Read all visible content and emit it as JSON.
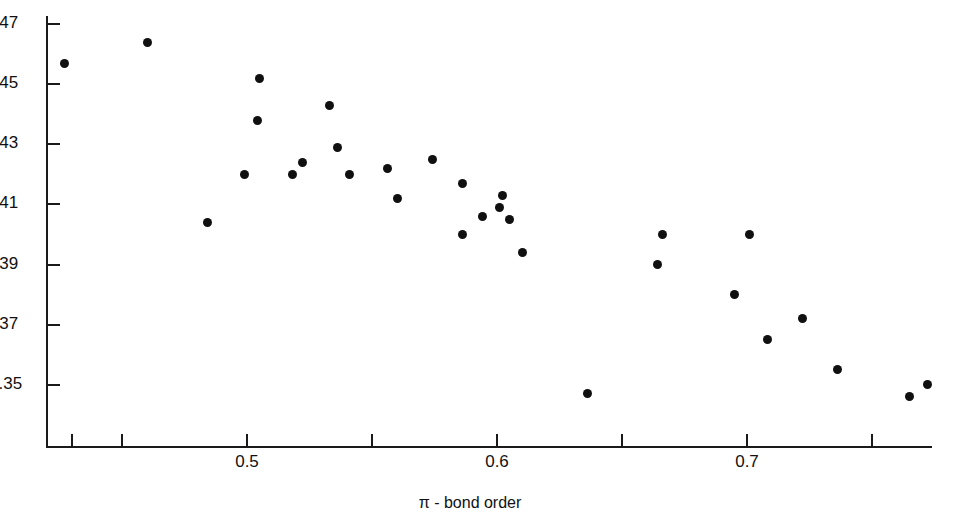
{
  "figure": {
    "background_color": "#ffffff",
    "marker_color": "#101010",
    "axis_color": "#1a1a1a"
  },
  "axes": {
    "x_title": "π - bond order",
    "x_tick_labels": [
      "0.5",
      "0.6",
      "0.7"
    ],
    "x_labeled_ticks": [
      0.5,
      0.6,
      0.7
    ],
    "x_all_ticks": [
      0.43,
      0.45,
      0.5,
      0.55,
      0.6,
      0.65,
      0.7,
      0.75
    ],
    "y_tick_labels": [
      "1.47",
      "1.45",
      "1.43",
      "1.41",
      "1.39",
      "1.37",
      "1.35"
    ],
    "y_ticks": [
      1.47,
      1.45,
      1.43,
      1.41,
      1.39,
      1.37,
      1.35
    ]
  },
  "chart_data": {
    "type": "scatter",
    "title": "",
    "xlabel": "π - bond order",
    "ylabel": "",
    "xlim": [
      0.419,
      0.776
    ],
    "ylim": [
      1.341,
      1.474
    ],
    "grid": false,
    "legend": "none",
    "x_ticks": [
      0.5,
      0.6,
      0.7
    ],
    "y_ticks": [
      1.35,
      1.37,
      1.39,
      1.41,
      1.43,
      1.45,
      1.47
    ],
    "series": [
      {
        "name": "bond length vs pi-bond order",
        "marker": "filled-circle",
        "color": "#101010",
        "points": [
          {
            "x": 0.427,
            "y": 1.457
          },
          {
            "x": 0.46,
            "y": 1.464
          },
          {
            "x": 0.484,
            "y": 1.404
          },
          {
            "x": 0.505,
            "y": 1.452
          },
          {
            "x": 0.504,
            "y": 1.438
          },
          {
            "x": 0.499,
            "y": 1.42
          },
          {
            "x": 0.518,
            "y": 1.42
          },
          {
            "x": 0.522,
            "y": 1.424
          },
          {
            "x": 0.533,
            "y": 1.443
          },
          {
            "x": 0.536,
            "y": 1.429
          },
          {
            "x": 0.541,
            "y": 1.42
          },
          {
            "x": 0.556,
            "y": 1.422
          },
          {
            "x": 0.56,
            "y": 1.412
          },
          {
            "x": 0.574,
            "y": 1.425
          },
          {
            "x": 0.586,
            "y": 1.417
          },
          {
            "x": 0.586,
            "y": 1.4
          },
          {
            "x": 0.594,
            "y": 1.406
          },
          {
            "x": 0.602,
            "y": 1.413
          },
          {
            "x": 0.601,
            "y": 1.409
          },
          {
            "x": 0.605,
            "y": 1.405
          },
          {
            "x": 0.61,
            "y": 1.394
          },
          {
            "x": 0.636,
            "y": 1.347
          },
          {
            "x": 0.666,
            "y": 1.4
          },
          {
            "x": 0.664,
            "y": 1.39
          },
          {
            "x": 0.701,
            "y": 1.4
          },
          {
            "x": 0.695,
            "y": 1.38
          },
          {
            "x": 0.708,
            "y": 1.365
          },
          {
            "x": 0.722,
            "y": 1.372
          },
          {
            "x": 0.736,
            "y": 1.355
          },
          {
            "x": 0.765,
            "y": 1.346
          },
          {
            "x": 0.772,
            "y": 1.35
          }
        ]
      }
    ]
  }
}
